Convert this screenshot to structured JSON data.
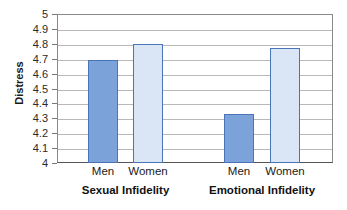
{
  "chart_data": {
    "type": "bar",
    "title": "",
    "subtitle": "",
    "xlabel": "",
    "ylabel": "Distress",
    "ylim": [
      4,
      5
    ],
    "ytick_step": 0.1,
    "ytick_labels": [
      "5",
      "4.9",
      "4.8",
      "4.7",
      "4.6",
      "4.5",
      "4.4",
      "4.3",
      "4.2",
      "4.1",
      "4"
    ],
    "grid": true,
    "legend": false,
    "legend_position": "none",
    "categories": [
      "Men",
      "Women"
    ],
    "groups": [
      "Sexual Infidelity",
      "Emotional Infidelity"
    ],
    "series": [
      {
        "name": "Men",
        "values": [
          4.69,
          4.33
        ]
      },
      {
        "name": "Women",
        "values": [
          4.8,
          4.77
        ]
      }
    ],
    "bars": [
      {
        "group": "Sexual Infidelity",
        "category": "Men",
        "value": 4.69,
        "style": "dark"
      },
      {
        "group": "Sexual Infidelity",
        "category": "Women",
        "value": 4.8,
        "style": "light"
      },
      {
        "group": "Emotional Infidelity",
        "category": "Men",
        "value": 4.33,
        "style": "dark"
      },
      {
        "group": "Emotional Infidelity",
        "category": "Women",
        "value": 4.77,
        "style": "light"
      }
    ],
    "colors": {
      "bar_dark_fill": "#7ba3da",
      "bar_light_fill": "#dae5f5",
      "bar_border": "#4a74b8",
      "gridline": "#b8b8b8",
      "axis": "#8a8a8a",
      "text": "#1a1a1a",
      "background": "#ffffff"
    }
  }
}
